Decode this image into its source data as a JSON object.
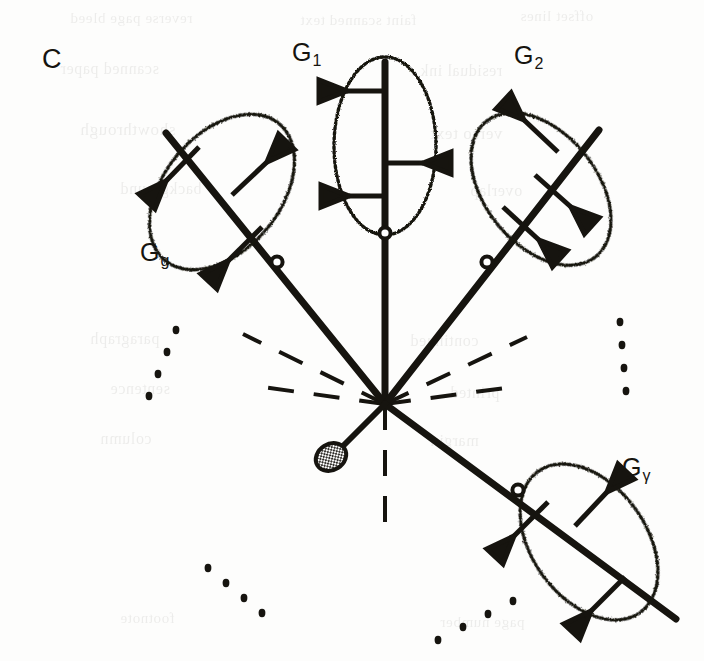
{
  "figure": {
    "panel_letter": "C",
    "width": 704,
    "height": 661,
    "background_color": "#fdfdfc",
    "ink_color": "#16140f",
    "type": "radial-gene-tree-diagram"
  },
  "labels": {
    "g1": {
      "base": "G",
      "sub": "1",
      "text": "G1"
    },
    "g2": {
      "base": "G",
      "sub": "2",
      "text": "G2"
    },
    "gg": {
      "base": "G",
      "sub": "g",
      "text": "Gg"
    },
    "ggamma": {
      "base": "G",
      "sub": "γ",
      "text": "Gγ"
    }
  },
  "diagram": {
    "hub": {
      "x": 385,
      "y": 404,
      "name": "root-node"
    },
    "stippled_node": {
      "x": 332,
      "y": 456,
      "rx": 15,
      "ry": 12,
      "name": "stippled-terminal-node"
    },
    "stub_line": {
      "x1": 385,
      "y1": 404,
      "x2": 338,
      "y2": 450
    },
    "solid_rays": [
      {
        "name": "ray-gg",
        "x1": 385,
        "y1": 404,
        "x2": 168,
        "y2": 137,
        "clade": "gg"
      },
      {
        "name": "ray-g1",
        "x1": 385,
        "y1": 404,
        "x2": 385,
        "y2": 63,
        "clade": "g1"
      },
      {
        "name": "ray-g2",
        "x1": 385,
        "y1": 404,
        "x2": 596,
        "y2": 133,
        "clade": "g2"
      },
      {
        "name": "ray-ggamma",
        "x1": 385,
        "y1": 404,
        "x2": 672,
        "y2": 616,
        "clade": "ggamma"
      }
    ],
    "dashed_rays": [
      {
        "name": "dashed-ray-left",
        "angle_deg": 188
      },
      {
        "name": "dashed-ray-upper-left",
        "angle_deg": 206
      },
      {
        "name": "dashed-ray-right",
        "angle_deg": 352
      },
      {
        "name": "dashed-ray-lower-right",
        "angle_deg": 334
      },
      {
        "name": "dashed-ray-down",
        "angle_deg": 95
      }
    ],
    "clades": [
      {
        "id": "gg",
        "label": "Gg",
        "ellipse": {
          "cx": 222,
          "cy": 192,
          "rx": 57,
          "ry": 88,
          "rotate_deg": 40
        },
        "root_circle": {
          "x": 277,
          "y": 262
        },
        "branch_count": 3,
        "branch_tip": "arrowhead"
      },
      {
        "id": "g1",
        "label": "G1",
        "ellipse": {
          "cx": 385,
          "cy": 146,
          "rx": 50,
          "ry": 88,
          "rotate_deg": 0
        },
        "root_circle": {
          "x": 385,
          "y": 233
        },
        "branch_count": 3,
        "branch_tip": "arrowhead"
      },
      {
        "id": "g2",
        "label": "G2",
        "ellipse": {
          "cx": 541,
          "cy": 189,
          "rx": 55,
          "ry": 86,
          "rotate_deg": -39
        },
        "root_circle": {
          "x": 487,
          "y": 262
        },
        "branch_count": 3,
        "branch_tip": "arrowhead"
      },
      {
        "id": "ggamma",
        "label": "Gγ",
        "ellipse": {
          "cx": 589,
          "cy": 542,
          "rx": 56,
          "ry": 86,
          "rotate_deg": -36
        },
        "root_circle": {
          "x": 518,
          "y": 490
        },
        "branch_count": 3,
        "branch_tip": "arrowhead"
      }
    ],
    "ellipsis_groups": [
      {
        "name": "ellipsis-left",
        "dots": 4,
        "x": 176,
        "y": 330,
        "dx": -9,
        "dy": 22
      },
      {
        "name": "ellipsis-right",
        "dots": 4,
        "x": 620,
        "y": 322,
        "dx": 2,
        "dy": 23
      },
      {
        "name": "ellipsis-bottom-left",
        "dots": 4,
        "x": 208,
        "y": 568,
        "dx": 18,
        "dy": 15
      },
      {
        "name": "ellipsis-bottom-right",
        "dots": 4,
        "x": 438,
        "y": 640,
        "dx": 25,
        "dy": -13
      }
    ]
  },
  "bleed_through_text": [
    {
      "text": "reverse page bleed",
      "x": 70,
      "y": 10,
      "size": 15
    },
    {
      "text": "faint scanned text",
      "x": 300,
      "y": 12,
      "size": 15
    },
    {
      "text": "offset lines",
      "x": 520,
      "y": 8,
      "size": 15
    },
    {
      "text": "scanned paper",
      "x": 60,
      "y": 60,
      "size": 16
    },
    {
      "text": "residual ink",
      "x": 420,
      "y": 62,
      "size": 16
    },
    {
      "text": "showthrough",
      "x": 80,
      "y": 120,
      "size": 17
    },
    {
      "text": "verso text",
      "x": 430,
      "y": 124,
      "size": 17
    },
    {
      "text": "background",
      "x": 120,
      "y": 180,
      "size": 16
    },
    {
      "text": "overlap",
      "x": 470,
      "y": 182,
      "size": 16
    },
    {
      "text": "paragraph",
      "x": 90,
      "y": 330,
      "size": 16
    },
    {
      "text": "continued",
      "x": 410,
      "y": 332,
      "size": 16
    },
    {
      "text": "sentence",
      "x": 110,
      "y": 380,
      "size": 16
    },
    {
      "text": "printed",
      "x": 450,
      "y": 384,
      "size": 16
    },
    {
      "text": "column",
      "x": 100,
      "y": 430,
      "size": 16
    },
    {
      "text": "margin",
      "x": 430,
      "y": 432,
      "size": 16
    },
    {
      "text": "footnote",
      "x": 120,
      "y": 610,
      "size": 15
    },
    {
      "text": "page number",
      "x": 440,
      "y": 614,
      "size": 15
    }
  ]
}
